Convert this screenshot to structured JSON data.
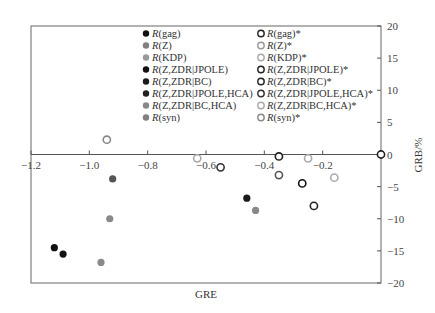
{
  "chart_data": {
    "type": "scatter",
    "title": "",
    "xlabel": "GRE",
    "ylabel": "GRB/%",
    "xlim": [
      -1.2,
      0
    ],
    "ylim": [
      -20,
      20
    ],
    "x_ticks": [
      -1.2,
      -1.0,
      -0.8,
      -0.6,
      -0.4,
      -0.2
    ],
    "x_tick_labels": [
      "-1.2",
      "-1.0",
      "-0.8",
      "-0.6",
      "-0.4",
      "-0.2"
    ],
    "y_ticks": [
      20,
      15,
      10,
      5,
      0,
      -5,
      -10,
      -15,
      -20
    ],
    "y_tick_labels": [
      "20",
      "15",
      "10",
      "5",
      "0",
      "-5",
      "-10",
      "-15",
      "-20"
    ],
    "y_axis_position": "right",
    "x_axis_position": "y=0",
    "grid": false,
    "legend_position": "upper center (two columns)",
    "series": [
      {
        "name": "R(gag)",
        "marker": "filled",
        "color": "#111111",
        "x": [
          -1.09
        ],
        "y": [
          -15.5
        ]
      },
      {
        "name": "R(Z)",
        "marker": "filled",
        "color": "#808080",
        "x": [
          -0.93
        ],
        "y": [
          -10
        ]
      },
      {
        "name": "R(KDP)",
        "marker": "filled",
        "color": "#9a9a9a",
        "x": [
          -0.96
        ],
        "y": [
          -16.8
        ]
      },
      {
        "name": "R(Z,ZDR|JPOLE)",
        "marker": "filled",
        "color": "#111111",
        "x": [
          -1.12
        ],
        "y": [
          -14.5
        ]
      },
      {
        "name": "R(Z,ZDR|BC)",
        "marker": "filled",
        "color": "#1a1a1a",
        "x": [
          -0.46
        ],
        "y": [
          -6.8
        ]
      },
      {
        "name": "R(Z,ZDR|JPOLE,HCA)",
        "marker": "filled",
        "color": "#555555",
        "x": [
          -0.92
        ],
        "y": [
          -3.8
        ]
      },
      {
        "name": "R(Z,ZDR|BC,HCA)",
        "marker": "filled",
        "color": "#888888",
        "x": [
          -0.43
        ],
        "y": [
          -8.7
        ]
      },
      {
        "name": "R(syn)",
        "marker": "filled",
        "color": "#777777",
        "x": [],
        "y": []
      },
      {
        "name": "R(gag)*",
        "marker": "open",
        "color": "#222222",
        "x": [
          0.0
        ],
        "y": [
          0.0
        ]
      },
      {
        "name": "R(Z)*",
        "marker": "open",
        "color": "#999999",
        "x": [
          -0.63
        ],
        "y": [
          -0.6
        ]
      },
      {
        "name": "R(KDP)*",
        "marker": "open",
        "color": "#aaaaaa",
        "x": [
          -0.16
        ],
        "y": [
          -3.6
        ]
      },
      {
        "name": "R(Z,ZDR|JPOLE)*",
        "marker": "open",
        "color": "#222222",
        "x": [
          -0.35
        ],
        "y": [
          -0.3
        ]
      },
      {
        "name": "R(Z,ZDR|BC)*",
        "marker": "open",
        "color": "#222222",
        "x": [
          -0.27
        ],
        "y": [
          -4.5
        ]
      },
      {
        "name": "R(Z,ZDR|JPOLE,HCA)*",
        "marker": "open",
        "color": "#333333",
        "x": [
          -0.23
        ],
        "y": [
          -8.0
        ]
      },
      {
        "name": "R(Z,ZDR|BC,HCA)*",
        "marker": "open",
        "color": "#aaaaaa",
        "x": [
          -0.25
        ],
        "y": [
          -0.6
        ]
      },
      {
        "name": "R(syn)*",
        "marker": "open",
        "color": "#888888",
        "x": [
          -0.94
        ],
        "y": [
          2.3
        ]
      },
      {
        "name": "extra-open-points",
        "marker": "open",
        "color": "#333333",
        "x": [
          -0.55,
          -0.35
        ],
        "y": [
          -2.0,
          -3.2
        ]
      }
    ]
  },
  "legend": {
    "left": [
      {
        "prefix": "R",
        "label": "(gag)",
        "style": "filled",
        "color": "#111111"
      },
      {
        "prefix": "R",
        "label": "(Z)",
        "style": "filled",
        "color": "#808080",
        "italic_arg": true
      },
      {
        "prefix": "R",
        "label": "(KDP)",
        "style": "filled",
        "color": "#9a9a9a"
      },
      {
        "prefix": "R",
        "label": "(Z,ZDR|JPOLE)",
        "style": "filled",
        "color": "#111111"
      },
      {
        "prefix": "R",
        "label": "(Z,ZDR|BC)",
        "style": "filled",
        "color": "#1a1a1a"
      },
      {
        "prefix": "R",
        "label": "(Z,ZDR|JPOLE,HCA)",
        "style": "filled",
        "color": "#222222"
      },
      {
        "prefix": "R",
        "label": "(Z,ZDR|BC,HCA)",
        "style": "filled",
        "color": "#888888"
      },
      {
        "prefix": "R",
        "label": "(syn)",
        "style": "filled",
        "color": "#808080"
      }
    ],
    "right": [
      {
        "prefix": "R",
        "label": "(gag)*",
        "style": "open",
        "color": "#222222"
      },
      {
        "prefix": "R",
        "label": "(Z)*",
        "style": "open",
        "color": "#999999"
      },
      {
        "prefix": "R",
        "label": "(KDP)*",
        "style": "open",
        "color": "#aaaaaa"
      },
      {
        "prefix": "R",
        "label": "(Z,ZDR|JPOLE)*",
        "style": "open",
        "color": "#222222"
      },
      {
        "prefix": "R",
        "label": "(Z,ZDR|BC)*",
        "style": "open",
        "color": "#222222"
      },
      {
        "prefix": "R",
        "label": "(Z,ZDR|JPOLE,HCA)*",
        "style": "open",
        "color": "#333333"
      },
      {
        "prefix": "R",
        "label": "(Z,ZDR|BC,HCA)*",
        "style": "open",
        "color": "#aaaaaa"
      },
      {
        "prefix": "R",
        "label": "(syn)*",
        "style": "open",
        "color": "#888888"
      }
    ]
  },
  "points": [
    {
      "x": -1.12,
      "y": -14.5,
      "style": "filled",
      "color": "#111111"
    },
    {
      "x": -1.09,
      "y": -15.5,
      "style": "filled",
      "color": "#111111"
    },
    {
      "x": -0.96,
      "y": -16.8,
      "style": "filled",
      "color": "#8a8a8a"
    },
    {
      "x": -0.93,
      "y": -10.0,
      "style": "filled",
      "color": "#8a8a8a"
    },
    {
      "x": -0.92,
      "y": -3.8,
      "style": "filled",
      "color": "#555555"
    },
    {
      "x": -0.46,
      "y": -6.8,
      "style": "filled",
      "color": "#1a1a1a"
    },
    {
      "x": -0.43,
      "y": -8.7,
      "style": "filled",
      "color": "#888888"
    },
    {
      "x": -0.94,
      "y": 2.3,
      "style": "open",
      "color": "#888888"
    },
    {
      "x": -0.63,
      "y": -0.6,
      "style": "open",
      "color": "#aaaaaa"
    },
    {
      "x": -0.55,
      "y": -2.0,
      "style": "open",
      "color": "#333333"
    },
    {
      "x": -0.35,
      "y": -0.3,
      "style": "open",
      "color": "#222222"
    },
    {
      "x": -0.35,
      "y": -3.2,
      "style": "open",
      "color": "#555555"
    },
    {
      "x": -0.27,
      "y": -4.5,
      "style": "open",
      "color": "#111111"
    },
    {
      "x": -0.25,
      "y": -0.6,
      "style": "open",
      "color": "#aaaaaa"
    },
    {
      "x": -0.16,
      "y": -3.6,
      "style": "open",
      "color": "#aaaaaa"
    },
    {
      "x": -0.23,
      "y": -8.0,
      "style": "open",
      "color": "#222222"
    },
    {
      "x": 0.0,
      "y": 0.0,
      "style": "open",
      "color": "#222222"
    }
  ],
  "colors": {
    "axis": "#555555",
    "frame": "#666666",
    "text": "#333333"
  }
}
